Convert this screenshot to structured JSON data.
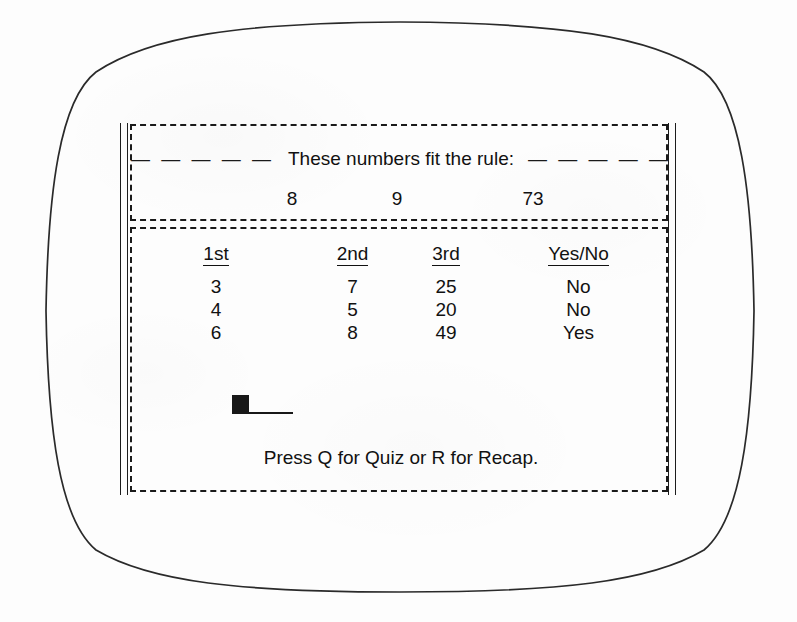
{
  "screen": {
    "header_panel": {
      "left_dashes": "— — — — —",
      "title": "These numbers fit the rule:",
      "right_dashes": "— — — — —",
      "numbers": [
        "8",
        "9",
        "73"
      ]
    },
    "body_panel": {
      "table": {
        "headers": [
          "1st",
          "2nd",
          "3rd",
          "Yes/No"
        ],
        "rows": [
          [
            "3",
            "7",
            "25",
            "No"
          ],
          [
            "4",
            "5",
            "20",
            "No"
          ],
          [
            "6",
            "8",
            "49",
            "Yes"
          ]
        ]
      },
      "input": {
        "value": "",
        "cursor": "block-cursor"
      },
      "prompt": "Press Q for Quiz or R for Recap."
    }
  },
  "colors": {
    "ink": "#111111",
    "bezel": "#2a2a2a",
    "background": "#fdfdfd",
    "cursor": "#181818"
  }
}
